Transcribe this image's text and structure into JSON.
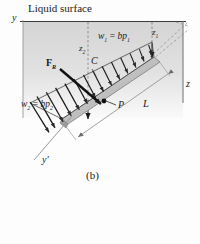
{
  "figure": {
    "caption": "(b)",
    "topic": "Hydrostatic pressure distribution on an inclined submerged plate",
    "surface_label": "Liquid surface"
  },
  "axes": [
    {
      "name": "y-axis",
      "label": "y"
    },
    {
      "name": "z-axis",
      "label": "z"
    },
    {
      "name": "y-prime-axis",
      "label": "y'"
    }
  ],
  "depths": [
    {
      "name": "z1",
      "base": "z",
      "sub": "1"
    },
    {
      "name": "z2",
      "base": "z",
      "sub": "2"
    }
  ],
  "loads": {
    "w1": {
      "w": "w",
      "wsub": "1",
      "eq": " = ",
      "expr": "bp",
      "esub": "1"
    },
    "w2": {
      "w": "w",
      "wsub": "2",
      "eq": " = ",
      "expr": "bp",
      "esub": "2"
    }
  },
  "points": [
    {
      "name": "centroid",
      "label": "C"
    },
    {
      "name": "center-of-pressure",
      "label": "P"
    }
  ],
  "force": {
    "symbol": "F",
    "sub": "R"
  },
  "dimensions": [
    {
      "name": "plate-length",
      "label": "L"
    }
  ],
  "colors": {
    "ink": "#1b1b1b",
    "liquid_top": "#d6d6d6",
    "liquid_bottom": "#f2f2f2",
    "plate_face": "#c9c9c9",
    "plate_edge": "#8e8e8e",
    "rule": "#9a9a9a"
  }
}
